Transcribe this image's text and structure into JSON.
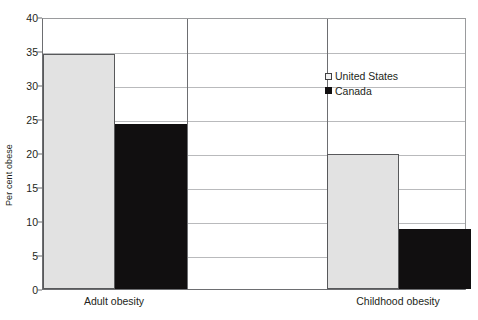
{
  "chart_data": {
    "type": "bar",
    "title": "",
    "xlabel": "",
    "ylabel": "Per cent obese",
    "categories": [
      "Adult obesity",
      "Childhood obesity"
    ],
    "series": [
      {
        "name": "United States",
        "color": "#e2e2e2",
        "values": [
          34.5,
          19.8
        ]
      },
      {
        "name": "Canada",
        "color": "#110f10",
        "values": [
          24.2,
          8.8
        ]
      }
    ],
    "ylim": [
      0,
      40
    ],
    "ytick_step": 5,
    "yticks": [
      "0",
      "5",
      "10",
      "15",
      "20",
      "25",
      "30",
      "35",
      "40"
    ],
    "grid": true,
    "legend_position": "upper-right-inside"
  },
  "axes": {
    "y_title": "Per cent obese"
  },
  "legend": {
    "entries": [
      {
        "label": "United States",
        "swatch": "light-gray-square"
      },
      {
        "label": "Canada",
        "swatch": "black-square"
      }
    ]
  }
}
